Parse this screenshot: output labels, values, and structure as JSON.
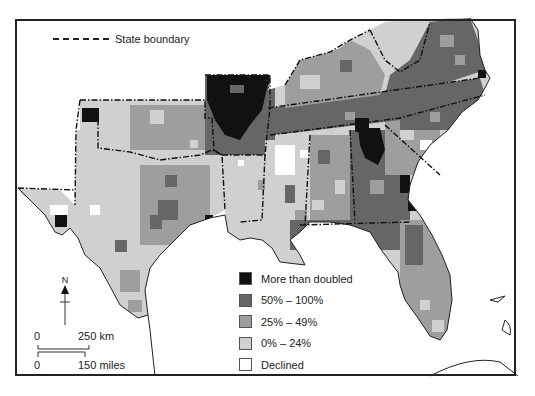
{
  "map": {
    "title": "",
    "boundary_key": {
      "label": "State boundary",
      "line_style": "dash-dot"
    },
    "legend": {
      "items": [
        {
          "label": "More than doubled",
          "color": "#111111"
        },
        {
          "label": "50% – 100%",
          "color": "#666666"
        },
        {
          "label": "25% – 49%",
          "color": "#9e9e9e"
        },
        {
          "label": "0% – 24%",
          "color": "#d0d0d0"
        },
        {
          "label": "Declined",
          "color": "#ffffff"
        }
      ]
    },
    "north_arrow": {
      "label": "N",
      "icon": "north-arrow-icon"
    },
    "scale_bar": {
      "km_start": "0",
      "km_end": "250 km",
      "mi_start": "0",
      "mi_end": "150 miles"
    },
    "colors": {
      "frame": "#222222",
      "water": "#ffffff",
      "doubled": "#111111",
      "high": "#666666",
      "mid": "#9e9e9e",
      "low": "#d0d0d0",
      "declined": "#ffffff"
    }
  }
}
